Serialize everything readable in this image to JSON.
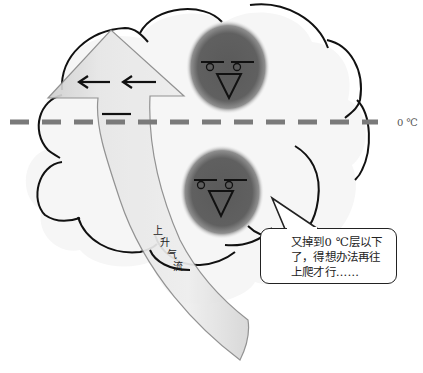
{
  "diagram": {
    "freezing_line": {
      "label": "0 ℃",
      "style": "dashed",
      "color": "#7a7a7a"
    },
    "cloud": {
      "fill": "#f7f7f7",
      "outline": "#111111"
    },
    "updraft_arrow": {
      "label_chars": [
        "上",
        "升",
        "气",
        "流"
      ],
      "label": "上升气流",
      "fill": "#e2e2e2",
      "edge": "#8a8a8a"
    },
    "wind_arrows": {
      "count": 2,
      "direction": "left"
    },
    "characters": [
      {
        "name": "upper-particle",
        "position": "above 0 ℃ line",
        "color": "#555555"
      },
      {
        "name": "lower-particle",
        "position": "below 0 ℃ line",
        "color": "#555555"
      }
    ],
    "speech_bubble": {
      "lines": [
        "又掉到0 ℃层以下",
        "了，得想办法再往",
        "上爬才行……"
      ]
    }
  }
}
